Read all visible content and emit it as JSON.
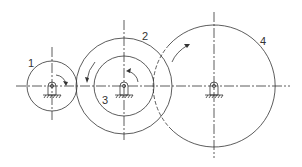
{
  "diagram": {
    "type": "gear-train",
    "colors": {
      "stroke": "#333333",
      "background": "#ffffff"
    },
    "gears": [
      {
        "id": "gear-1",
        "label": "1",
        "cx": 52,
        "cy": 86,
        "r": 25
      },
      {
        "id": "gear-2",
        "label": "2",
        "cx": 124,
        "cy": 86,
        "r": 48
      },
      {
        "id": "gear-3",
        "label": "3",
        "cx": 124,
        "cy": 86,
        "r": 30
      },
      {
        "id": "gear-4",
        "label": "4",
        "cx": 214,
        "cy": 86,
        "r": 61
      }
    ],
    "labels": {
      "gear1": "1",
      "gear2": "2",
      "gear3": "3",
      "gear4": "4"
    }
  }
}
